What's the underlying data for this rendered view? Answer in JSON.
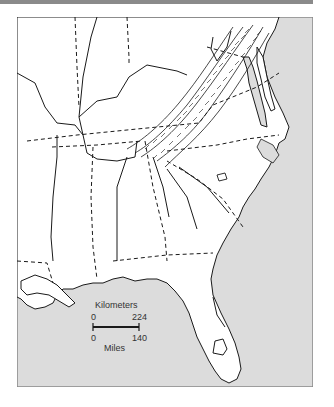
{
  "map": {
    "region": "Southeastern United States",
    "features": [
      "state-boundaries",
      "rivers",
      "appalachian-ridges",
      "atlantic-coastline",
      "gulf-coastline",
      "lake-okeechobee",
      "chesapeake-bay"
    ],
    "colors": {
      "land": "#ffffff",
      "water": "#dcdcdc",
      "line": "#1a1a1a",
      "frame": "#888888"
    }
  },
  "scale_bar": {
    "km_label": "Kilometers",
    "km_start": "0",
    "km_end": "224",
    "mi_start": "0",
    "mi_end": "140",
    "mi_label": "Miles"
  }
}
